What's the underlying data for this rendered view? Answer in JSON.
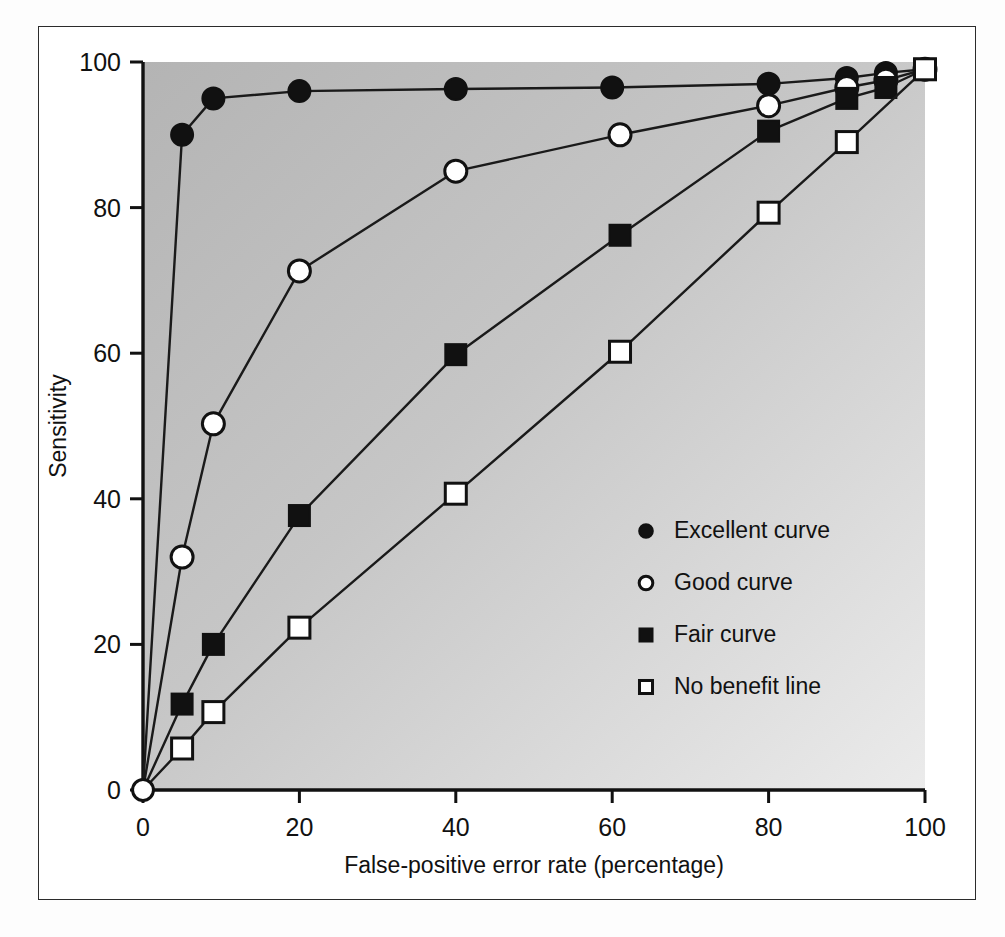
{
  "figure": {
    "background_color": "#ffffff",
    "frame_color": "#2b2b2b",
    "plot_fill_top_left": "#b7b7b7",
    "plot_fill_bottom_right": "#e9e9e9",
    "line_color": "#1a1a1a",
    "marker_fill_solid": "#111111",
    "marker_fill_open": "#ffffff"
  },
  "chart_data": {
    "type": "line",
    "title": "",
    "xlabel": "False-positive error rate (percentage)",
    "ylabel": "Sensitivity",
    "xlim": [
      0,
      100
    ],
    "ylim": [
      0,
      100
    ],
    "xticks": [
      0,
      20,
      40,
      60,
      80,
      100
    ],
    "yticks": [
      0,
      20,
      40,
      60,
      80,
      100
    ],
    "xticklabels": [
      "0",
      "20",
      "40",
      "60",
      "80",
      "100"
    ],
    "yticklabels": [
      "0",
      "20",
      "40",
      "60",
      "80",
      "100"
    ],
    "grid": false,
    "legend_position": "center-right-inside",
    "series": [
      {
        "name": "Excellent curve",
        "marker": "filled-circle",
        "x": [
          0,
          5,
          9,
          20,
          40,
          60,
          80,
          90,
          95,
          100
        ],
        "y": [
          0,
          90,
          95,
          96,
          96.3,
          96.5,
          97,
          97.8,
          98.5,
          99
        ]
      },
      {
        "name": "Good curve",
        "marker": "open-circle",
        "x": [
          0,
          5,
          9,
          20,
          40,
          61,
          80,
          90,
          95,
          100
        ],
        "y": [
          0,
          32,
          50.3,
          71.3,
          85,
          90,
          94,
          96.5,
          97.5,
          99
        ]
      },
      {
        "name": "Fair curve",
        "marker": "filled-square",
        "x": [
          0,
          5,
          9,
          20,
          40,
          61,
          80,
          90,
          95,
          100
        ],
        "y": [
          0,
          11.8,
          20,
          37.7,
          59.8,
          76.2,
          90.5,
          95,
          96.5,
          99
        ]
      },
      {
        "name": "No benefit line",
        "marker": "open-square",
        "x": [
          0,
          5,
          9,
          20,
          40,
          61,
          80,
          90,
          100
        ],
        "y": [
          0,
          5.7,
          10.7,
          22.3,
          40.7,
          60.2,
          79.3,
          89,
          99
        ]
      }
    ]
  },
  "legend": {
    "items": [
      {
        "label": "Excellent curve",
        "marker": "filled-circle"
      },
      {
        "label": "Good curve",
        "marker": "open-circle"
      },
      {
        "label": "Fair curve",
        "marker": "filled-square"
      },
      {
        "label": "No benefit line",
        "marker": "open-square"
      }
    ]
  }
}
